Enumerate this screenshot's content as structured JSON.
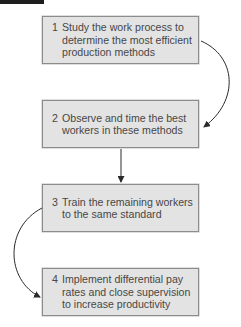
{
  "diagram": {
    "type": "flowchart",
    "colors": {
      "box_fill": "#e3e3e3",
      "box_border": "#8c8c8c",
      "text": "#474747",
      "arrow": "#2a2a2a"
    },
    "steps": [
      {
        "number": "1",
        "text": "Study the work process to\ndetermine the most efficient\nproduction methods"
      },
      {
        "number": "2",
        "text": "Observe and time the best\nworkers in these methods"
      },
      {
        "number": "3",
        "text": "Train the remaining workers\nto the same standard"
      },
      {
        "number": "4",
        "text": "Implement differential pay\nrates and close supervision\nto increase productivity"
      }
    ],
    "connectors": [
      {
        "from": "1",
        "to": "2",
        "style": "curved-right"
      },
      {
        "from": "2",
        "to": "3",
        "style": "straight-down"
      },
      {
        "from": "3",
        "to": "4",
        "style": "curved-left"
      }
    ]
  }
}
